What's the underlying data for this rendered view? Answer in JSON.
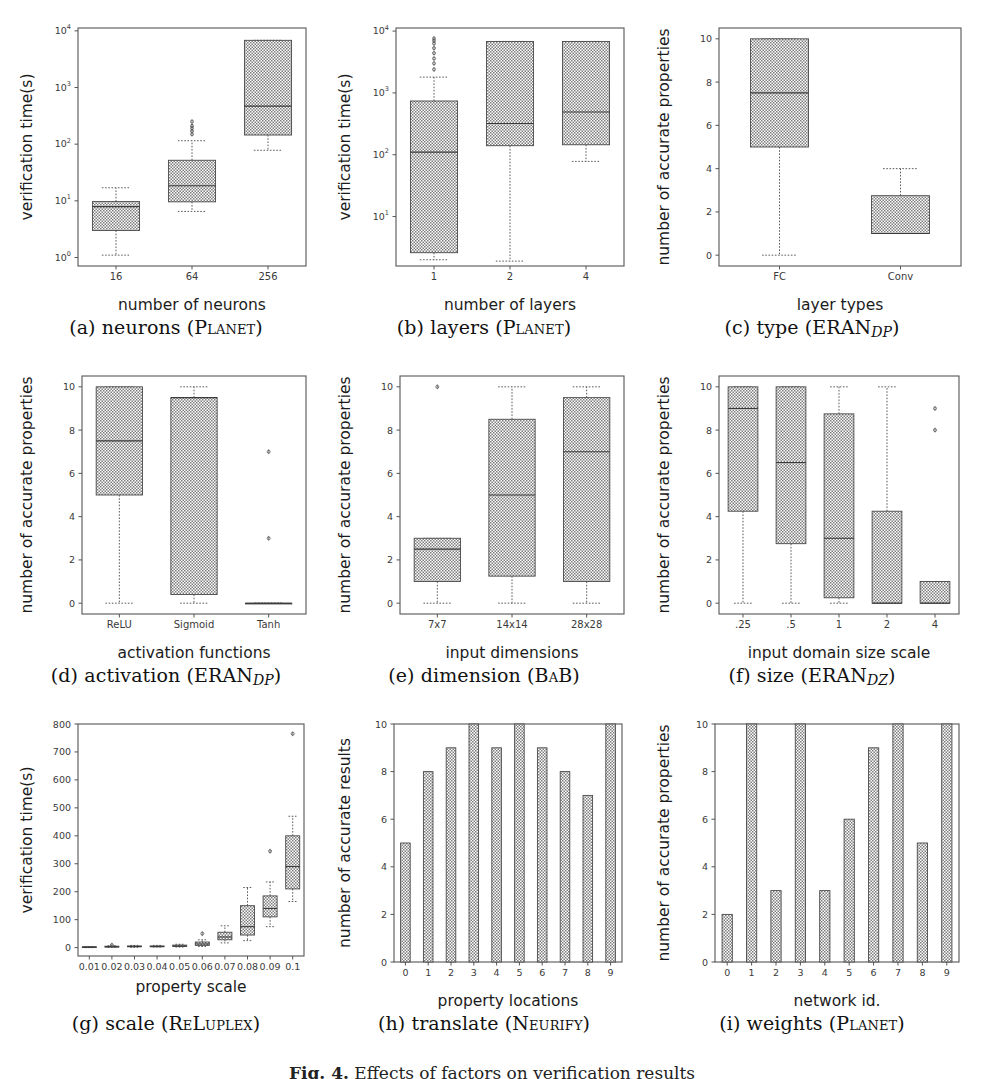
{
  "figure": {
    "caption_prefix": "Fig. 4.",
    "caption_text": "Effects of factors on verification results",
    "panel_count": 9,
    "box_fill": "#9a9a9a",
    "box_edge": "#4a4a4a",
    "axis_color": "#555555"
  },
  "panels": [
    {
      "id": "a",
      "subcaption_letter": "(a)",
      "subcaption_name": "neurons",
      "subcaption_tool": "Planet",
      "subcaption_sub": "",
      "xlabel": "number of neurons",
      "ylabel": "verification time(s)",
      "xticks": [
        "16",
        "64",
        "256"
      ],
      "yticks": [
        "10⁰",
        "10¹",
        "10²",
        "10³",
        "10⁴"
      ]
    },
    {
      "id": "b",
      "subcaption_letter": "(b)",
      "subcaption_name": "layers",
      "subcaption_tool": "Planet",
      "subcaption_sub": "",
      "xlabel": "number of layers",
      "ylabel": "verification time(s)",
      "xticks": [
        "1",
        "2",
        "4"
      ],
      "yticks": [
        "10¹",
        "10²",
        "10³",
        "10⁴"
      ]
    },
    {
      "id": "c",
      "subcaption_letter": "(c)",
      "subcaption_name": "type",
      "subcaption_tool": "ERAN",
      "subcaption_sub": "DP",
      "xlabel": "layer types",
      "ylabel": "number of accurate properties",
      "xticks": [
        "FC",
        "Conv"
      ],
      "yticks": [
        "0",
        "2",
        "4",
        "6",
        "8",
        "10"
      ]
    },
    {
      "id": "d",
      "subcaption_letter": "(d)",
      "subcaption_name": "activation",
      "subcaption_tool": "ERAN",
      "subcaption_sub": "DP",
      "xlabel": "activation functions",
      "ylabel": "number of accurate properties",
      "xticks": [
        "ReLU",
        "Sigmoid",
        "Tanh"
      ],
      "yticks": [
        "0",
        "2",
        "4",
        "6",
        "8",
        "10"
      ]
    },
    {
      "id": "e",
      "subcaption_letter": "(e)",
      "subcaption_name": "dimension",
      "subcaption_tool": "BaB",
      "subcaption_sub": "",
      "xlabel": "input dimensions",
      "ylabel": "number of accurate properties",
      "xticks": [
        "7x7",
        "14x14",
        "28x28"
      ],
      "yticks": [
        "0",
        "2",
        "4",
        "6",
        "8",
        "10"
      ]
    },
    {
      "id": "f",
      "subcaption_letter": "(f)",
      "subcaption_name": "size",
      "subcaption_tool": "ERAN",
      "subcaption_sub": "DZ",
      "xlabel": "input domain size scale",
      "ylabel": "number of accurate properties",
      "xticks": [
        ".25",
        ".5",
        "1",
        "2",
        "4"
      ],
      "yticks": [
        "0",
        "2",
        "4",
        "6",
        "8",
        "10"
      ]
    },
    {
      "id": "g",
      "subcaption_letter": "(g)",
      "subcaption_name": "scale",
      "subcaption_tool": "ReLuplex",
      "subcaption_sub": "",
      "xlabel": "property scale",
      "ylabel": "verification time(s)",
      "xticks": [
        "0.01",
        "0.02",
        "0.03",
        "0.04",
        "0.05",
        "0.06",
        "0.07",
        "0.08",
        "0.09",
        "0.1"
      ],
      "yticks": [
        "0",
        "100",
        "200",
        "300",
        "400",
        "500",
        "600",
        "700",
        "800"
      ]
    },
    {
      "id": "h",
      "subcaption_letter": "(h)",
      "subcaption_name": "translate",
      "subcaption_tool": "Neurify",
      "subcaption_sub": "",
      "xlabel": "property locations",
      "ylabel": "number of accurate results",
      "xticks": [
        "0",
        "1",
        "2",
        "3",
        "4",
        "5",
        "6",
        "7",
        "8",
        "9"
      ],
      "yticks": [
        "0",
        "2",
        "4",
        "6",
        "8",
        "10"
      ]
    },
    {
      "id": "i",
      "subcaption_letter": "(i)",
      "subcaption_name": "weights",
      "subcaption_tool": "Planet",
      "subcaption_sub": "",
      "xlabel": "network id.",
      "ylabel": "number of accurate properties",
      "xticks": [
        "0",
        "1",
        "2",
        "3",
        "4",
        "5",
        "6",
        "7",
        "8",
        "9"
      ],
      "yticks": [
        "0",
        "2",
        "4",
        "6",
        "8",
        "10"
      ]
    }
  ],
  "chart_data": [
    {
      "panel": "a",
      "type": "box",
      "title": "(a) neurons (Planet)",
      "xlabel": "number of neurons",
      "ylabel": "verification time(s)",
      "yscale": "log",
      "ylim": [
        1,
        10000
      ],
      "categories": [
        "16",
        "64",
        "256"
      ],
      "boxes": [
        {
          "category": "16",
          "whislo": 1.1,
          "q1": 3.0,
          "med": 7.9,
          "q3": 9.7,
          "whishi": 17.0,
          "fliers": []
        },
        {
          "category": "64",
          "whislo": 6.5,
          "q1": 9.6,
          "med": 18.5,
          "q3": 52.0,
          "whishi": 115.0,
          "fliers": [
            150,
            170,
            190,
            210,
            250
          ]
        },
        {
          "category": "256",
          "whislo": 78.0,
          "q1": 145.0,
          "med": 470.0,
          "q3": 6800.0,
          "whishi": 6800.0,
          "fliers": []
        }
      ]
    },
    {
      "panel": "b",
      "type": "box",
      "title": "(b) layers (Planet)",
      "xlabel": "number of layers",
      "ylabel": "verification time(s)",
      "yscale": "log",
      "ylim": [
        1.5,
        10000
      ],
      "categories": [
        "1",
        "2",
        "4"
      ],
      "boxes": [
        {
          "category": "1",
          "whislo": 2.0,
          "q1": 2.6,
          "med": 110.0,
          "q3": 740.0,
          "whishi": 1800.0,
          "fliers": [
            2400,
            3000,
            3600,
            4400,
            5300,
            6300,
            7000,
            7600
          ]
        },
        {
          "category": "2",
          "whislo": 1.9,
          "q1": 140.0,
          "med": 320.0,
          "q3": 6800.0,
          "whishi": 6800.0,
          "fliers": []
        },
        {
          "category": "4",
          "whislo": 78.0,
          "q1": 145.0,
          "med": 490.0,
          "q3": 6800.0,
          "whishi": 6800.0,
          "fliers": []
        }
      ]
    },
    {
      "panel": "c",
      "type": "box",
      "title": "(c) type (ERAN_DP)",
      "xlabel": "layer types",
      "ylabel": "number of accurate properties",
      "yscale": "linear",
      "ylim": [
        -0.5,
        10.5
      ],
      "categories": [
        "FC",
        "Conv"
      ],
      "boxes": [
        {
          "category": "FC",
          "whislo": 0.0,
          "q1": 5.0,
          "med": 7.5,
          "q3": 10.0,
          "whishi": 10.0,
          "fliers": []
        },
        {
          "category": "Conv",
          "whislo": 1.0,
          "q1": 1.0,
          "med": 1.0,
          "q3": 2.75,
          "whishi": 4.0,
          "fliers": []
        }
      ]
    },
    {
      "panel": "d",
      "type": "box",
      "title": "(d) activation (ERAN_DP)",
      "xlabel": "activation functions",
      "ylabel": "number of accurate properties",
      "yscale": "linear",
      "ylim": [
        -0.5,
        10.5
      ],
      "categories": [
        "ReLU",
        "Sigmoid",
        "Tanh"
      ],
      "boxes": [
        {
          "category": "ReLU",
          "whislo": 0.0,
          "q1": 5.0,
          "med": 7.5,
          "q3": 10.0,
          "whishi": 10.0,
          "fliers": []
        },
        {
          "category": "Sigmoid",
          "whislo": 0.0,
          "q1": 0.4,
          "med": 9.5,
          "q3": 9.5,
          "whishi": 10.0,
          "fliers": []
        },
        {
          "category": "Tanh",
          "whislo": 0.0,
          "q1": 0.0,
          "med": 0.0,
          "q3": 0.0,
          "whishi": 0.0,
          "fliers": [
            3.0,
            7.0
          ]
        }
      ]
    },
    {
      "panel": "e",
      "type": "box",
      "title": "(e) dimension (BaB)",
      "xlabel": "input dimensions",
      "ylabel": "number of accurate properties",
      "yscale": "linear",
      "ylim": [
        -0.5,
        10.5
      ],
      "categories": [
        "7x7",
        "14x14",
        "28x28"
      ],
      "boxes": [
        {
          "category": "7x7",
          "whislo": 0.0,
          "q1": 1.0,
          "med": 2.5,
          "q3": 3.0,
          "whishi": 3.0,
          "fliers": [
            10.0
          ]
        },
        {
          "category": "14x14",
          "whislo": 0.0,
          "q1": 1.25,
          "med": 5.0,
          "q3": 8.5,
          "whishi": 10.0,
          "fliers": []
        },
        {
          "category": "28x28",
          "whislo": 0.0,
          "q1": 1.0,
          "med": 7.0,
          "q3": 9.5,
          "whishi": 10.0,
          "fliers": []
        }
      ]
    },
    {
      "panel": "f",
      "type": "box",
      "title": "(f) size (ERAN_DZ)",
      "xlabel": "input domain size scale",
      "ylabel": "number of accurate properties",
      "yscale": "linear",
      "ylim": [
        -0.5,
        10.5
      ],
      "categories": [
        ".25",
        ".5",
        "1",
        "2",
        "4"
      ],
      "boxes": [
        {
          "category": ".25",
          "whislo": 0.0,
          "q1": 4.25,
          "med": 9.0,
          "q3": 10.0,
          "whishi": 10.0,
          "fliers": []
        },
        {
          "category": ".5",
          "whislo": 0.0,
          "q1": 2.75,
          "med": 6.5,
          "q3": 10.0,
          "whishi": 10.0,
          "fliers": []
        },
        {
          "category": "1",
          "whislo": 0.0,
          "q1": 0.25,
          "med": 3.0,
          "q3": 8.75,
          "whishi": 10.0,
          "fliers": []
        },
        {
          "category": "2",
          "whislo": 0.0,
          "q1": 0.0,
          "med": 0.0,
          "q3": 4.25,
          "whishi": 10.0,
          "fliers": []
        },
        {
          "category": "4",
          "whislo": 0.0,
          "q1": 0.0,
          "med": 0.0,
          "q3": 1.0,
          "whishi": 1.0,
          "fliers": [
            8.0,
            9.0
          ]
        }
      ]
    },
    {
      "panel": "g",
      "type": "box",
      "title": "(g) scale (ReLuplex)",
      "xlabel": "property scale",
      "ylabel": "verification time(s)",
      "yscale": "linear",
      "ylim": [
        -30,
        800
      ],
      "categories": [
        "0.01",
        "0.02",
        "0.03",
        "0.04",
        "0.05",
        "0.06",
        "0.07",
        "0.08",
        "0.09",
        "0.1"
      ],
      "boxes": [
        {
          "category": "0.01",
          "whislo": 0,
          "q1": 1,
          "med": 2,
          "q3": 3,
          "whishi": 4,
          "fliers": []
        },
        {
          "category": "0.02",
          "whislo": 1,
          "q1": 2,
          "med": 3,
          "q3": 5,
          "whishi": 7,
          "fliers": [
            9
          ]
        },
        {
          "category": "0.03",
          "whislo": 1,
          "q1": 3,
          "med": 4,
          "q3": 6,
          "whishi": 8,
          "fliers": []
        },
        {
          "category": "0.04",
          "whislo": 2,
          "q1": 3,
          "med": 4,
          "q3": 6,
          "whishi": 8,
          "fliers": []
        },
        {
          "category": "0.05",
          "whislo": 2,
          "q1": 4,
          "med": 6,
          "q3": 9,
          "whishi": 12,
          "fliers": []
        },
        {
          "category": "0.06",
          "whislo": 4,
          "q1": 8,
          "med": 13,
          "q3": 20,
          "whishi": 28,
          "fliers": [
            50
          ]
        },
        {
          "category": "0.07",
          "whislo": 17,
          "q1": 28,
          "med": 38,
          "q3": 55,
          "whishi": 78,
          "fliers": []
        },
        {
          "category": "0.08",
          "whislo": 25,
          "q1": 45,
          "med": 75,
          "q3": 150,
          "whishi": 215,
          "fliers": []
        },
        {
          "category": "0.09",
          "whislo": 75,
          "q1": 110,
          "med": 140,
          "q3": 185,
          "whishi": 235,
          "fliers": [
            345
          ]
        },
        {
          "category": "0.1",
          "whislo": 165,
          "q1": 210,
          "med": 290,
          "q3": 400,
          "whishi": 470,
          "fliers": [
            765
          ]
        }
      ]
    },
    {
      "panel": "h",
      "type": "bar",
      "title": "(h) translate (Neurify)",
      "xlabel": "property locations",
      "ylabel": "number of accurate results",
      "categories": [
        "0",
        "1",
        "2",
        "3",
        "4",
        "5",
        "6",
        "7",
        "8",
        "9"
      ],
      "values": [
        5,
        8,
        9,
        10,
        9,
        10,
        9,
        8,
        7,
        10
      ],
      "ylim": [
        0,
        10
      ]
    },
    {
      "panel": "i",
      "type": "bar",
      "title": "(i) weights (Planet)",
      "xlabel": "network id.",
      "ylabel": "number of accurate properties",
      "categories": [
        "0",
        "1",
        "2",
        "3",
        "4",
        "5",
        "6",
        "7",
        "8",
        "9"
      ],
      "values": [
        2,
        10,
        3,
        10,
        3,
        6,
        9,
        10,
        5,
        10
      ],
      "ylim": [
        0,
        10
      ]
    }
  ]
}
